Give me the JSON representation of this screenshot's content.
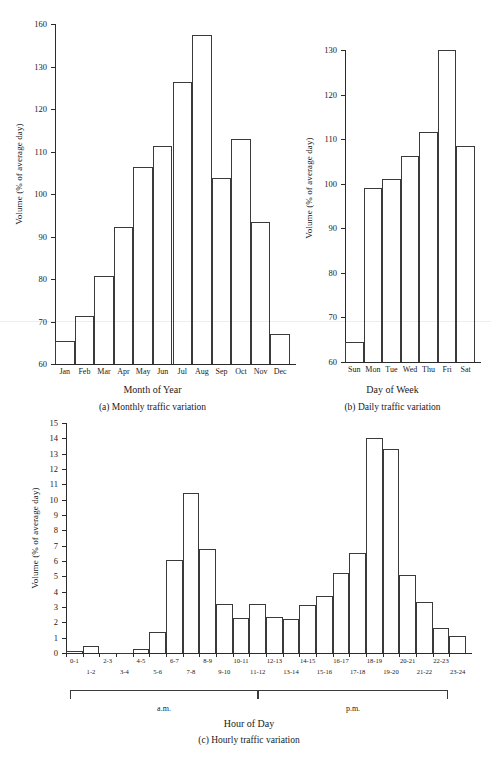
{
  "figure": {
    "background": "#ffffff",
    "ink": "#2b2b2b"
  },
  "charts": {
    "monthly": {
      "caption": "(a) Monthly traffic variation",
      "xlabel": "Month of Year",
      "ylabel": "Volume (% of average day)"
    },
    "daily": {
      "caption": "(b) Daily traffic variation",
      "xlabel": "Day of Week",
      "ylabel": "Volume (% of average day)"
    },
    "hourly": {
      "caption": "(c) Hourly traffic variation",
      "xlabel": "Hour of Day",
      "ylabel": "Volume (% of average day)",
      "am_label": "a.m.",
      "pm_label": "p.m."
    }
  },
  "chart_data": [
    {
      "id": "monthly",
      "type": "bar",
      "title": "(a) Monthly traffic variation",
      "xlabel": "Month of Year",
      "ylabel": "Volume (% of average day)",
      "categories": [
        "Jan",
        "Feb",
        "Mar",
        "Apr",
        "May",
        "Jun",
        "Jul",
        "Aug",
        "Sep",
        "Oct",
        "Nov",
        "Dec"
      ],
      "values": [
        65.5,
        71.2,
        80.8,
        92.2,
        106.3,
        111.3,
        126.3,
        152.0,
        103.8,
        113.0,
        93.3,
        67.0
      ],
      "ylim": [
        60,
        160
      ],
      "ytick_values": [
        60,
        70,
        80,
        90,
        100,
        110,
        120,
        130,
        160
      ],
      "ytick_labels": [
        "60",
        "70",
        "80",
        "90",
        "100",
        "110",
        "120",
        "130",
        "160"
      ],
      "grid": false,
      "legend": "none"
    },
    {
      "id": "daily",
      "type": "bar",
      "title": "(b) Daily traffic variation",
      "xlabel": "Day of Week",
      "ylabel": "Volume (% of average day)",
      "categories": [
        "Sun",
        "Mon",
        "Tue",
        "Wed",
        "Thu",
        "Fri",
        "Sat"
      ],
      "values": [
        64.5,
        99.0,
        101.0,
        106.2,
        111.5,
        134.0,
        108.5
      ],
      "ylim": [
        60,
        135
      ],
      "ytick_values": [
        60,
        70,
        80,
        90,
        100,
        110,
        120,
        130
      ],
      "ytick_labels": [
        "60",
        "70",
        "80",
        "90",
        "100",
        "110",
        "120",
        "130"
      ],
      "grid": false,
      "legend": "none"
    },
    {
      "id": "hourly",
      "type": "bar",
      "title": "(c) Hourly traffic variation",
      "xlabel": "Hour of Day",
      "ylabel": "Volume (% of average day)",
      "categories": [
        "0-1",
        "1-2",
        "2-3",
        "3-4",
        "4-5",
        "5-6",
        "6-7",
        "7-8",
        "8-9",
        "9-10",
        "10-11",
        "11-12",
        "12-13",
        "13-14",
        "14-15",
        "15-16",
        "16-17",
        "17-18",
        "18-19",
        "19-20",
        "20-21",
        "21-22",
        "22-23",
        "23-24"
      ],
      "values": [
        0.15,
        0.45,
        0.0,
        0.0,
        0.25,
        1.35,
        6.05,
        10.45,
        6.8,
        3.2,
        2.3,
        3.2,
        2.35,
        2.2,
        3.1,
        3.7,
        5.2,
        6.5,
        14.0,
        13.3,
        5.1,
        3.3,
        1.6,
        1.1
      ],
      "ylim": [
        0,
        15
      ],
      "ytick_values": [
        0,
        1,
        2,
        3,
        4,
        5,
        6,
        7,
        8,
        9,
        10,
        11,
        12,
        13,
        14,
        15
      ],
      "ytick_labels": [
        "0",
        "1",
        "2",
        "3",
        "4",
        "5",
        "6",
        "7",
        "8",
        "9",
        "10",
        "11",
        "12",
        "13",
        "14",
        "15"
      ],
      "annotations": [
        "a.m.",
        "p.m."
      ],
      "grid": false,
      "legend": "none"
    }
  ]
}
